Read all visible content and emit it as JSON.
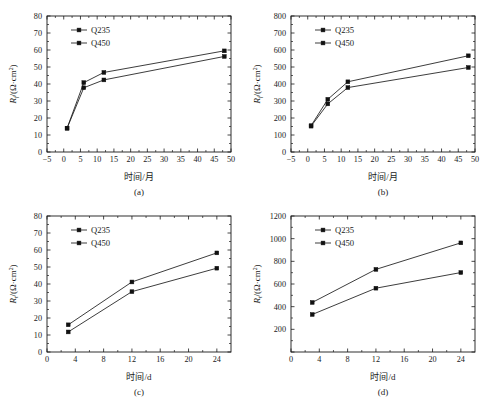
{
  "figure": {
    "background": "#ffffff",
    "line_color": "#1a1a1a",
    "marker_color": "#111111"
  },
  "chart_data": [
    {
      "id": "a",
      "type": "line",
      "panel_label": "(a)",
      "title": "",
      "xlabel": "时间/月",
      "ylabel": "R_f/(Ω·cm²)",
      "ylabel_parts": {
        "symbol": "R",
        "subscript": "f",
        "unit": "/(Ω·cm",
        "sup": "2",
        "tail": ")"
      },
      "xlim": [
        -5,
        50
      ],
      "ylim": [
        0,
        80
      ],
      "xticks": [
        -5,
        0,
        5,
        10,
        15,
        20,
        25,
        30,
        35,
        40,
        45,
        50
      ],
      "yticks": [
        0,
        10,
        20,
        30,
        40,
        50,
        60,
        70,
        80
      ],
      "xticklabels": [
        "−5",
        "0",
        "5",
        "10",
        "15",
        "20",
        "25",
        "30",
        "35",
        "40",
        "45",
        "50"
      ],
      "yticklabels": [
        "0",
        "10",
        "20",
        "30",
        "40",
        "50",
        "60",
        "70",
        "80"
      ],
      "grid": false,
      "legend_position": "upper-left-inside",
      "x": [
        1,
        6,
        12,
        48
      ],
      "series": [
        {
          "name": "Q235",
          "values": [
            14.0,
            40.8,
            46.8,
            59.5
          ]
        },
        {
          "name": "Q450",
          "values": [
            14.0,
            37.8,
            42.4,
            56.2
          ]
        }
      ]
    },
    {
      "id": "b",
      "type": "line",
      "panel_label": "(b)",
      "title": "",
      "xlabel": "时间/月",
      "ylabel": "R_f/(Ω·cm²)",
      "ylabel_parts": {
        "symbol": "R",
        "subscript": "f",
        "unit": "/(Ω·cm",
        "sup": "2",
        "tail": ")"
      },
      "xlim": [
        -5,
        50
      ],
      "ylim": [
        0,
        800
      ],
      "xticks": [
        -5,
        0,
        5,
        10,
        15,
        20,
        25,
        30,
        35,
        40,
        45,
        50
      ],
      "yticks": [
        0,
        100,
        200,
        300,
        400,
        500,
        600,
        700,
        800
      ],
      "xticklabels": [
        "−5",
        "0",
        "5",
        "10",
        "15",
        "20",
        "25",
        "30",
        "35",
        "40",
        "45",
        "50"
      ],
      "yticklabels": [
        "0",
        "100",
        "200",
        "300",
        "400",
        "500",
        "600",
        "700",
        "800"
      ],
      "grid": false,
      "legend_position": "upper-left-inside",
      "x": [
        1,
        6,
        12,
        48
      ],
      "series": [
        {
          "name": "Q235",
          "values": [
            155,
            310,
            413,
            566
          ]
        },
        {
          "name": "Q450",
          "values": [
            152,
            283,
            379,
            497
          ]
        }
      ]
    },
    {
      "id": "c",
      "type": "line",
      "panel_label": "(c)",
      "title": "",
      "xlabel": "时间/d",
      "ylabel": "R_t/(Ω·cm²)",
      "ylabel_parts": {
        "symbol": "R",
        "subscript": "t",
        "unit": "/(Ω·cm",
        "sup": "2",
        "tail": ")"
      },
      "xlim": [
        0,
        26
      ],
      "ylim": [
        0,
        80
      ],
      "xticks": [
        0,
        4,
        8,
        12,
        16,
        20,
        24
      ],
      "yticks": [
        0,
        10,
        20,
        30,
        40,
        50,
        60,
        70,
        80
      ],
      "xticklabels": [
        "0",
        "4",
        "8",
        "12",
        "16",
        "20",
        "24"
      ],
      "yticklabels": [
        "0",
        "10",
        "20",
        "30",
        "40",
        "50",
        "60",
        "70",
        "80"
      ],
      "grid": false,
      "legend_position": "upper-left-inside",
      "x": [
        3,
        12,
        24
      ],
      "series": [
        {
          "name": "Q235",
          "values": [
            16.0,
            41.2,
            58.3
          ]
        },
        {
          "name": "Q450",
          "values": [
            11.8,
            35.5,
            49.3
          ]
        }
      ]
    },
    {
      "id": "d",
      "type": "line",
      "panel_label": "(d)",
      "title": "",
      "xlabel": "时间/d",
      "ylabel": "R_t/(Ω·cm²)",
      "ylabel_parts": {
        "symbol": "R",
        "subscript": "t",
        "unit": "/(Ω·cm",
        "sup": "2",
        "tail": ")"
      },
      "xlim": [
        0,
        26
      ],
      "ylim": [
        0,
        1200
      ],
      "xticks": [
        0,
        4,
        8,
        12,
        16,
        20,
        24
      ],
      "yticks": [
        0,
        200,
        400,
        600,
        800,
        1000,
        1200
      ],
      "xticklabels": [
        "0",
        "4",
        "8",
        "12",
        "16",
        "20",
        "24"
      ],
      "yticklabels": [
        "",
        "200",
        "400",
        "600",
        "800",
        "1000",
        "1200"
      ],
      "grid": false,
      "legend_position": "upper-left-inside",
      "x": [
        3,
        12,
        24
      ],
      "series": [
        {
          "name": "Q235",
          "values": [
            437,
            729,
            963
          ]
        },
        {
          "name": "Q450",
          "values": [
            331,
            563,
            701
          ]
        }
      ]
    }
  ]
}
